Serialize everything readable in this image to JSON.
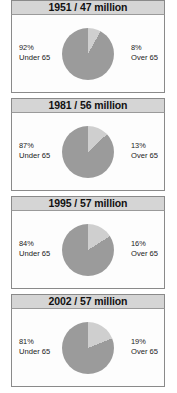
{
  "figure": {
    "name": "population-age-breakdown",
    "colors": {
      "under65_slice": "#9b9b9b",
      "over65_slice": "#cfcfcf",
      "header_bg": "#d5d5d5",
      "panel_bg": "#fdfdfd",
      "border": "#8a8a8a",
      "text": "#1b1b1b"
    }
  },
  "panels": [
    {
      "title": "1951 / 47 million",
      "year": "1951",
      "population": "47 million",
      "left": {
        "percent": "92%",
        "category": "Under 65",
        "value": 92
      },
      "right": {
        "percent": "8%",
        "category": "Over 65",
        "value": 8
      }
    },
    {
      "title": "1981 / 56 million",
      "year": "1981",
      "population": "56 million",
      "left": {
        "percent": "87%",
        "category": "Under 65",
        "value": 87
      },
      "right": {
        "percent": "13%",
        "category": "Over 65",
        "value": 13
      }
    },
    {
      "title": "1995 / 57 million",
      "year": "1995",
      "population": "57 million",
      "left": {
        "percent": "84%",
        "category": "Under 65",
        "value": 84
      },
      "right": {
        "percent": "16%",
        "category": "Over 65",
        "value": 16
      }
    },
    {
      "title": "2002 / 57 million",
      "year": "2002",
      "population": "57 million",
      "left": {
        "percent": "81%",
        "category": "Under 65",
        "value": 81
      },
      "right": {
        "percent": "19%",
        "category": "Over 65",
        "value": 19
      }
    }
  ],
  "chart_data": [
    {
      "type": "pie",
      "title": "1951 / 47 million",
      "labels": [
        "Under 65",
        "Over 65"
      ],
      "values": [
        92,
        8
      ],
      "unit": "percent",
      "colors": [
        "#9b9b9b",
        "#cfcfcf"
      ],
      "start_angle_deg": 0,
      "direction": "clockwise",
      "legend": "side-labels"
    },
    {
      "type": "pie",
      "title": "1981 / 56 million",
      "labels": [
        "Under 65",
        "Over 65"
      ],
      "values": [
        87,
        13
      ],
      "unit": "percent",
      "colors": [
        "#9b9b9b",
        "#cfcfcf"
      ],
      "start_angle_deg": 0,
      "direction": "clockwise",
      "legend": "side-labels"
    },
    {
      "type": "pie",
      "title": "1995 / 57 million",
      "labels": [
        "Under 65",
        "Over 65"
      ],
      "values": [
        84,
        16
      ],
      "unit": "percent",
      "colors": [
        "#9b9b9b",
        "#cfcfcf"
      ],
      "start_angle_deg": 0,
      "direction": "clockwise",
      "legend": "side-labels"
    },
    {
      "type": "pie",
      "title": "2002 / 57 million",
      "labels": [
        "Under 65",
        "Over 65"
      ],
      "values": [
        81,
        19
      ],
      "unit": "percent",
      "colors": [
        "#9b9b9b",
        "#cfcfcf"
      ],
      "start_angle_deg": 0,
      "direction": "clockwise",
      "legend": "side-labels"
    }
  ]
}
